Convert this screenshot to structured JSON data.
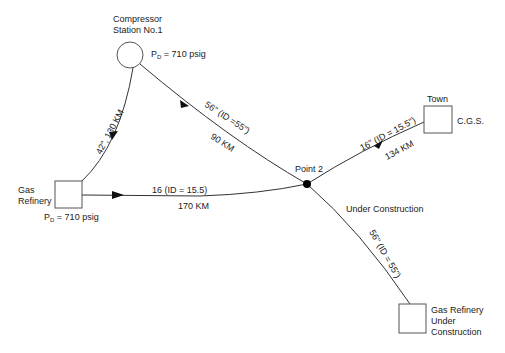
{
  "diagram": {
    "type": "pipeline-network",
    "nodes": {
      "compressor": {
        "title_line1": "Compressor",
        "title_line2": "Station No.1",
        "pressure_prefix": "P",
        "pressure_sub": "D",
        "pressure_value": " = 710 psig",
        "shape": "circle"
      },
      "gas_refinery": {
        "title_line1": "Gas",
        "title_line2": "Refinery",
        "pressure_prefix": "P",
        "pressure_sub": "D",
        "pressure_value": " = 710 psig",
        "shape": "square"
      },
      "point2": {
        "label": "Point 2",
        "shape": "dot"
      },
      "town": {
        "title": "Town",
        "side_label": "C.G.S.",
        "shape": "square"
      },
      "refinery_uc": {
        "line1": "Gas Refinery",
        "line2": "Under",
        "line3": "Construction",
        "shape": "square"
      }
    },
    "pipes": {
      "refinery_to_compressor": {
        "label": "42\", 130 KM"
      },
      "compressor_to_point2": {
        "size_label": "56\" (ID =55\")",
        "length_label": "90 KM"
      },
      "refinery_to_point2": {
        "size_label": "16 (ID = 15.5)",
        "length_label": "170 KM"
      },
      "point2_to_town": {
        "size_label": "16\" (ID = 15.5\")",
        "length_label": "134 KM"
      },
      "point2_to_refinery_uc": {
        "status_label": "Under Construction",
        "size_label": "56\" (ID = 55\")"
      }
    },
    "colors": {
      "line": "#333333",
      "node_stroke": "#555555",
      "text": "#222222",
      "background": "#ffffff"
    }
  }
}
